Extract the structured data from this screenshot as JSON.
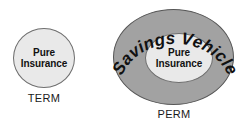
{
  "diagram": {
    "colors": {
      "outer_ellipse_fill": "#a2a2a2",
      "inner_ellipse_fill": "#e9e9e9",
      "stroke": "#555555",
      "text": "#111111",
      "background": "#ffffff"
    },
    "groups": [
      {
        "id": "term",
        "caption": "TERM",
        "inner_label_line1": "Pure",
        "inner_label_line2": "Insurance"
      },
      {
        "id": "perm",
        "caption": "PERM",
        "outer_label": "Savings Vehicle",
        "inner_label_line1": "Pure",
        "inner_label_line2": "Insurance"
      }
    ]
  }
}
